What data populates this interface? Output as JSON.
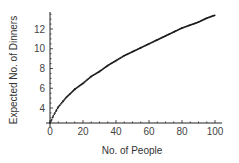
{
  "chart_data": {
    "type": "scatter",
    "title": "",
    "xlabel": "No. of People",
    "ylabel": "Expected No. of Dinners",
    "xlim": [
      0,
      100
    ],
    "ylim": [
      2.5,
      13.8
    ],
    "x_ticks": [
      0,
      20,
      40,
      60,
      80,
      100
    ],
    "y_ticks": [
      4,
      6,
      8,
      10,
      12
    ],
    "grid": false,
    "legend": null,
    "series": [
      {
        "name": "Expected No. of Dinners",
        "x": [
          1,
          2,
          3,
          4,
          5,
          6,
          8,
          10,
          12,
          15,
          20,
          25,
          30,
          35,
          40,
          45,
          50,
          55,
          60,
          65,
          70,
          75,
          80,
          85,
          90,
          95,
          100
        ],
        "y": [
          2.8,
          3.2,
          3.5,
          3.8,
          4.1,
          4.3,
          4.7,
          5.1,
          5.4,
          5.9,
          6.5,
          7.2,
          7.7,
          8.3,
          8.8,
          9.3,
          9.7,
          10.1,
          10.5,
          10.9,
          11.3,
          11.7,
          12.1,
          12.4,
          12.7,
          13.1,
          13.4
        ]
      }
    ]
  }
}
